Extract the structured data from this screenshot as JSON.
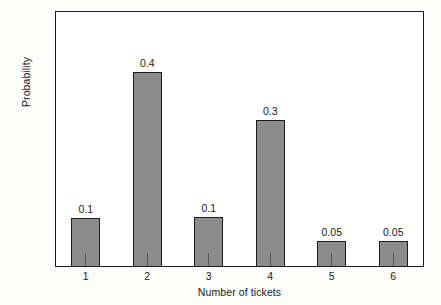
{
  "chart_data": {
    "type": "bar",
    "title": "",
    "xlabel": "Number of tickets",
    "ylabel": "Probability",
    "categories": [
      "1",
      "2",
      "3",
      "4",
      "5",
      "6"
    ],
    "values": [
      0.1,
      0.4,
      0.1,
      0.3,
      0.05,
      0.05
    ],
    "drawn_values": [
      0.095,
      0.38,
      0.097,
      0.288,
      0.05,
      0.05
    ],
    "data_labels": [
      "0.1",
      "0.4",
      "0.1",
      "0.3",
      "0.05",
      "0.05"
    ],
    "ylim": [
      0,
      0.5
    ],
    "yticks": [
      0,
      0.1,
      0.2,
      0.3,
      0.4,
      0.5
    ],
    "ytick_labels": [
      "0",
      "0.1",
      "0.2",
      "0.3",
      "0.4",
      "0.5"
    ],
    "grid": false,
    "legend": null,
    "bar_color": "#8c8c8c",
    "bar_edge_color": "#1c1c1c",
    "axis_color": "#1a1a1a",
    "plot_background": "#ffffff",
    "figure_background": "#fdfdfb"
  }
}
